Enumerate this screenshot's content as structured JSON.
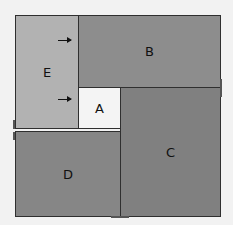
{
  "pieces": [
    {
      "id": "E",
      "label": "E",
      "color": "#b2b2b2"
    },
    {
      "id": "B",
      "label": "B",
      "color": "#8d8d8d"
    },
    {
      "id": "A",
      "label": "A",
      "color": "#f4f4f4"
    },
    {
      "id": "C",
      "label": "C",
      "color": "#808080"
    },
    {
      "id": "D",
      "label": "D",
      "color": "#868686"
    }
  ],
  "arrows": [
    {
      "direction": "right",
      "target": "B"
    },
    {
      "direction": "right",
      "target": "A"
    }
  ]
}
